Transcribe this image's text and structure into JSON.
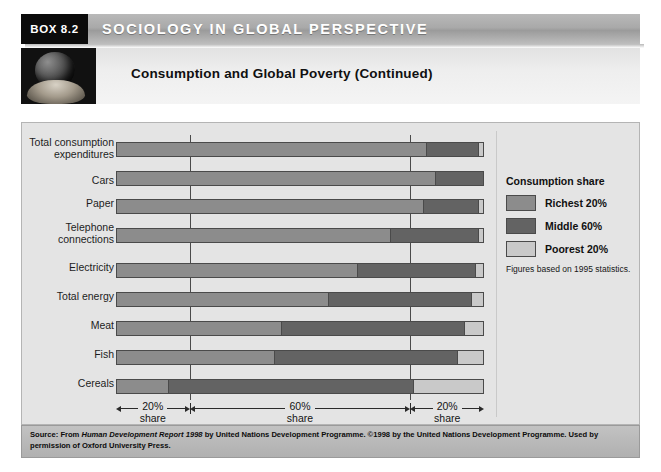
{
  "header": {
    "box_number": "BOX 8.2",
    "banner_title": "SOCIOLOGY IN GLOBAL PERSPECTIVE",
    "subheader_title": "Consumption and Global Poverty (Continued)",
    "globe_icon": "globe-in-hands-icon"
  },
  "legend": {
    "title": "Consumption share",
    "items": [
      {
        "label": "Richest 20%",
        "color": "#8c8c8c"
      },
      {
        "label": "Middle 60%",
        "color": "#636363"
      },
      {
        "label": "Poorest 20%",
        "color": "#c9c9c9"
      }
    ],
    "note": "Figures based on 1995 statistics."
  },
  "axis": {
    "segments": [
      {
        "top": "20%",
        "bottom": "share"
      },
      {
        "top": "60%",
        "bottom": "share"
      },
      {
        "top": "20%",
        "bottom": "share"
      }
    ]
  },
  "source": {
    "prefix": "Source: From ",
    "title_italic": "Human Development Report 1998",
    "rest": " by United Nations Development Programme. ©1998 by the United Nations Development Programme. Used by permission of Oxford University Press."
  },
  "chart_data": {
    "type": "bar",
    "orientation": "horizontal",
    "stacked": true,
    "title": "Consumption and Global Poverty (Continued)",
    "xlabel": "",
    "ylabel": "",
    "xlim": [
      0,
      100
    ],
    "grid": true,
    "legend_position": "right",
    "units": "percent of total consumption share",
    "gridlines": [
      20,
      80
    ],
    "categories": [
      "Total consumption expenditures",
      "Cars",
      "Paper",
      "Telephone connections",
      "Electricity",
      "Total energy",
      "Meat",
      "Fish",
      "Cereals"
    ],
    "series": [
      {
        "name": "Richest 20%",
        "color": "#8c8c8c",
        "values": [
          85,
          87,
          84,
          75,
          66,
          58,
          45,
          43,
          14
        ]
      },
      {
        "name": "Middle 60%",
        "color": "#636363",
        "values": [
          14,
          13,
          15,
          24,
          32,
          39,
          50,
          50,
          67
        ]
      },
      {
        "name": "Poorest 20%",
        "color": "#c9c9c9",
        "values": [
          1,
          0,
          1,
          1,
          2,
          3,
          5,
          7,
          19
        ]
      }
    ],
    "annotations": [
      "20% share",
      "60% share",
      "20% share"
    ],
    "footnote": "Figures based on 1995 statistics."
  }
}
